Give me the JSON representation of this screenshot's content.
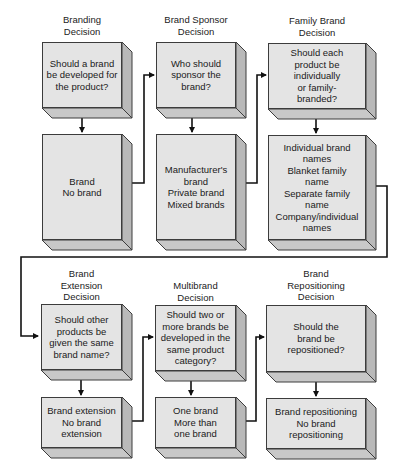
{
  "diagram": {
    "top_row": [
      {
        "title": "Branding\nDecision",
        "question": "Should a brand\nbe developed for\nthe product?",
        "options": "Brand\nNo brand"
      },
      {
        "title": "Brand Sponsor\nDecision",
        "question": "Who should\nsponsor the\nbrand?",
        "options": "Manufacturer's\nbrand\nPrivate brand\nMixed brands"
      },
      {
        "title": "Family Brand\nDecision",
        "question": "Should each\nproduct be\nindividually\nor family-\nbranded?",
        "options": "Individual brand\nnames\nBlanket family\nname\nSeparate family\nname\nCompany/individual\nnames"
      }
    ],
    "bottom_row": [
      {
        "title": "Brand\nExtension\nDecision",
        "question": "Should other\nproducts be\ngiven the same\nbrand name?",
        "options": "Brand extension\nNo brand\nextension"
      },
      {
        "title": "Multibrand\nDecision",
        "question": "Should two or\nmore brands be\ndeveloped in the\nsame product\ncategory?",
        "options": "One brand\nMore than\none brand"
      },
      {
        "title": "Brand\nRepositioning\nDecision",
        "question": "Should the\nbrand be\nrepositioned?",
        "options": "Brand repositioning\nNo brand\nrepositioning"
      }
    ],
    "colors": {
      "box_front": "#e4e4e4",
      "box_side": "#b9b9b9",
      "box_bottom": "#c8c8c8",
      "border": "#3c3c3c",
      "connector": "#111111"
    }
  }
}
